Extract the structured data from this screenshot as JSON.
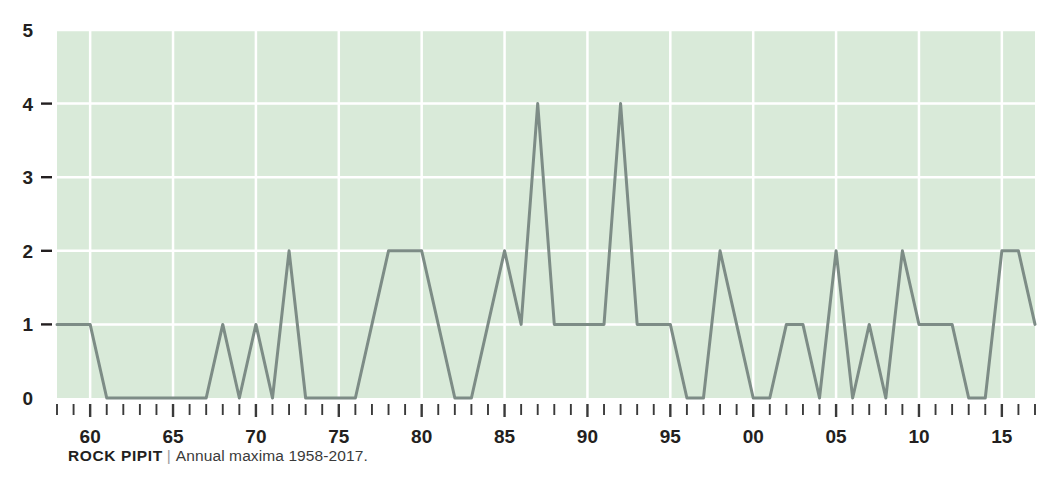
{
  "caption": {
    "species": "ROCK PIPIT",
    "separator": "|",
    "subtitle": "Annual maxima 1958-2017."
  },
  "chart_data": {
    "type": "line",
    "title": "ROCK PIPIT",
    "subtitle": "Annual maxima 1958-2017.",
    "xlabel": "",
    "ylabel": "",
    "ylim": [
      0,
      5
    ],
    "xlim": [
      1958,
      2017
    ],
    "grid": true,
    "legend": null,
    "y_ticks": [
      0,
      1,
      2,
      3,
      4,
      5
    ],
    "y_tick_labels": [
      "0",
      "1",
      "2",
      "3",
      "4",
      "5"
    ],
    "x_ticks": [
      1960,
      1965,
      1970,
      1975,
      1980,
      1985,
      1990,
      1995,
      2000,
      2005,
      2010,
      2015
    ],
    "x_tick_labels": [
      "60",
      "65",
      "70",
      "75",
      "80",
      "85",
      "90",
      "95",
      "00",
      "05",
      "10",
      "15"
    ],
    "x_minor_tick_interval": 1,
    "plot_background": "#d9ead9",
    "gridline_color": "#ffffff",
    "line_color": "#7d8c86",
    "line_width": 3,
    "x": [
      1958,
      1959,
      1960,
      1961,
      1962,
      1963,
      1964,
      1965,
      1966,
      1967,
      1968,
      1969,
      1970,
      1971,
      1972,
      1973,
      1974,
      1975,
      1976,
      1977,
      1978,
      1979,
      1980,
      1981,
      1982,
      1983,
      1984,
      1985,
      1986,
      1987,
      1988,
      1989,
      1990,
      1991,
      1992,
      1993,
      1994,
      1995,
      1996,
      1997,
      1998,
      1999,
      2000,
      2001,
      2002,
      2003,
      2004,
      2005,
      2006,
      2007,
      2008,
      2009,
      2010,
      2011,
      2012,
      2013,
      2014,
      2015,
      2016,
      2017
    ],
    "values": [
      1,
      1,
      1,
      0,
      0,
      0,
      0,
      0,
      0,
      0,
      1,
      0,
      1,
      0,
      2,
      0,
      0,
      0,
      0,
      1,
      2,
      2,
      2,
      1,
      0,
      0,
      1,
      2,
      1,
      4,
      1,
      1,
      1,
      1,
      4,
      1,
      1,
      1,
      0,
      0,
      2,
      1,
      0,
      0,
      1,
      1,
      0,
      2,
      0,
      1,
      0,
      2,
      1,
      1,
      1,
      0,
      0,
      2,
      2,
      1
    ]
  },
  "axis": {
    "y_labels": [
      "5",
      "4",
      "3",
      "2",
      "1",
      "0"
    ],
    "x_labels": [
      "60",
      "65",
      "70",
      "75",
      "80",
      "85",
      "90",
      "95",
      "00",
      "05",
      "10",
      "15"
    ]
  }
}
